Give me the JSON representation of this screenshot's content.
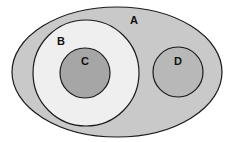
{
  "diagram": {
    "type": "venn",
    "sets": [
      {
        "id": "A",
        "label": "A",
        "shape": "ellipse",
        "cx": 117,
        "cy": 72,
        "rx": 105,
        "ry": 65,
        "fill": "#c9c9c9"
      },
      {
        "id": "B",
        "label": "B",
        "shape": "circle",
        "cx": 86,
        "cy": 73,
        "r": 53,
        "fill": "#efefef",
        "inside": "A"
      },
      {
        "id": "C",
        "label": "C",
        "shape": "circle",
        "cx": 85,
        "cy": 73,
        "r": 25,
        "fill": "#a6a6a6",
        "inside": "B"
      },
      {
        "id": "D",
        "label": "D",
        "shape": "circle",
        "cx": 178,
        "cy": 72,
        "r": 25,
        "fill": "#b8b8b8",
        "inside": "A"
      }
    ],
    "stroke": "#1a1a1a"
  }
}
